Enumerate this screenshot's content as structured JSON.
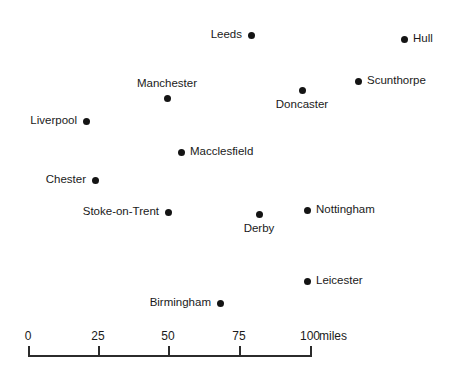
{
  "chart_data": {
    "type": "scatter",
    "title": "",
    "xlabel": "",
    "ylabel": "",
    "grid": false,
    "legend": null,
    "units": "miles",
    "scale": {
      "ticks": [
        {
          "value": "0",
          "x": 28
        },
        {
          "value": "25",
          "x": 98
        },
        {
          "value": "50",
          "x": 168
        },
        {
          "value": "75",
          "x": 239
        },
        {
          "value": "100",
          "x": 310
        }
      ],
      "units_label": "miles",
      "bar_left_px": 28,
      "bar_right_px": 310,
      "miles_per_100px": 100
    },
    "points": [
      {
        "name": "Leeds",
        "x": 251,
        "y": 35,
        "label_pos": "left"
      },
      {
        "name": "Hull",
        "x": 404,
        "y": 39,
        "label_pos": "right"
      },
      {
        "name": "Scunthorpe",
        "x": 358,
        "y": 81,
        "label_pos": "right"
      },
      {
        "name": "Manchester",
        "x": 167,
        "y": 98,
        "label_pos": "above"
      },
      {
        "name": "Doncaster",
        "x": 302,
        "y": 90,
        "label_pos": "below"
      },
      {
        "name": "Liverpool",
        "x": 86,
        "y": 121,
        "label_pos": "left"
      },
      {
        "name": "Macclesfield",
        "x": 181,
        "y": 152,
        "label_pos": "right"
      },
      {
        "name": "Chester",
        "x": 95,
        "y": 180,
        "label_pos": "left"
      },
      {
        "name": "Stoke-on-Trent",
        "x": 168,
        "y": 212,
        "label_pos": "left"
      },
      {
        "name": "Derby",
        "x": 259,
        "y": 214,
        "label_pos": "below"
      },
      {
        "name": "Nottingham",
        "x": 307,
        "y": 210,
        "label_pos": "right"
      },
      {
        "name": "Leicester",
        "x": 307,
        "y": 281,
        "label_pos": "right"
      },
      {
        "name": "Birmingham",
        "x": 220,
        "y": 303,
        "label_pos": "left"
      }
    ]
  },
  "colors": {
    "dot": "#141414",
    "text": "#1a1a1a",
    "rule": "#2b2b2b",
    "background": "#ffffff"
  }
}
